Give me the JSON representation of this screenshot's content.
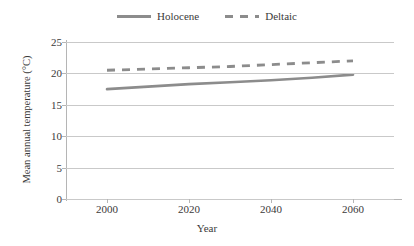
{
  "chart_data": {
    "type": "line",
    "title": "",
    "xlabel": "Year",
    "ylabel": "Mean annual temperature (°C)",
    "xlim": [
      1990,
      2070
    ],
    "ylim": [
      0,
      25
    ],
    "xticks": [
      2000,
      2020,
      2040,
      2060
    ],
    "yticks": [
      0,
      5,
      10,
      15,
      20,
      25
    ],
    "grid": true,
    "legend_position": "top-center",
    "x": [
      2000,
      2010,
      2020,
      2030,
      2040,
      2050,
      2060
    ],
    "series": [
      {
        "name": "Holocene",
        "style": "solid",
        "color": "#8c8c8c",
        "values": [
          17.5,
          17.9,
          18.3,
          18.6,
          18.9,
          19.3,
          19.8
        ]
      },
      {
        "name": "Deltaic",
        "style": "dashed",
        "color": "#8c8c8c",
        "values": [
          20.5,
          20.7,
          20.9,
          21.1,
          21.4,
          21.7,
          22.0
        ]
      }
    ]
  },
  "legend": {
    "entries": [
      {
        "label": "Holocene"
      },
      {
        "label": "Deltaic"
      }
    ]
  },
  "axes": {
    "y_title": "Mean annual temperature (°C)",
    "x_title": "Year",
    "y_tick_labels": [
      "25",
      "20",
      "15",
      "10",
      "5",
      "0"
    ],
    "x_tick_labels": [
      "2000",
      "2020",
      "2040",
      "2060"
    ]
  },
  "colors": {
    "line": "#8c8c8c",
    "grid": "#c9c9c9",
    "axis": "#b5b5b5",
    "text": "#3a3a3a",
    "background": "#ffffff"
  }
}
